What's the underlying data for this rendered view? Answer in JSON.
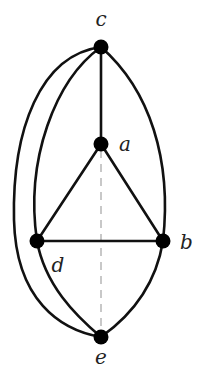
{
  "diagram": {
    "type": "graph",
    "nodes": [
      {
        "id": "c",
        "label": "c",
        "x": 101,
        "y": 47,
        "lx": 101,
        "ly": 26,
        "anchor": "middle"
      },
      {
        "id": "a",
        "label": "a",
        "x": 101,
        "y": 144,
        "lx": 119,
        "ly": 151,
        "anchor": "start"
      },
      {
        "id": "d",
        "label": "d",
        "x": 37,
        "y": 241,
        "lx": 58,
        "ly": 272,
        "anchor": "middle"
      },
      {
        "id": "b",
        "label": "b",
        "x": 163,
        "y": 241,
        "lx": 180,
        "ly": 249,
        "anchor": "start"
      },
      {
        "id": "e",
        "label": "e",
        "x": 101,
        "y": 337,
        "lx": 101,
        "ly": 364,
        "anchor": "middle"
      }
    ],
    "edges": [
      {
        "from": "c",
        "to": "a",
        "style": "solid",
        "shape": "straight"
      },
      {
        "from": "a",
        "to": "d",
        "style": "solid",
        "shape": "straight"
      },
      {
        "from": "a",
        "to": "b",
        "style": "solid",
        "shape": "straight"
      },
      {
        "from": "d",
        "to": "b",
        "style": "solid",
        "shape": "straight"
      },
      {
        "from": "c",
        "to": "d",
        "style": "solid",
        "shape": "curve"
      },
      {
        "from": "c",
        "to": "b",
        "style": "solid",
        "shape": "curve"
      },
      {
        "from": "d",
        "to": "e",
        "style": "solid",
        "shape": "curve"
      },
      {
        "from": "b",
        "to": "e",
        "style": "solid",
        "shape": "curve"
      },
      {
        "from": "c",
        "to": "e",
        "style": "solid",
        "shape": "outer-curve"
      },
      {
        "from": "a",
        "to": "e",
        "style": "dashed",
        "shape": "straight"
      }
    ],
    "colors": {
      "edge": "#111111",
      "node": "#000000",
      "dashed": "#c8c8c8"
    }
  }
}
